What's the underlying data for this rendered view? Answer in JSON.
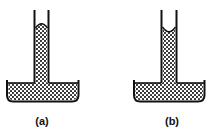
{
  "figure": {
    "panels": [
      {
        "label": "(a)",
        "meniscus": "convex"
      },
      {
        "label": "(b)",
        "meniscus": "concave"
      }
    ],
    "colors": {
      "stroke": "#111111",
      "liquid_fill": "#ffffff",
      "liquid_dots": "#222222"
    }
  }
}
